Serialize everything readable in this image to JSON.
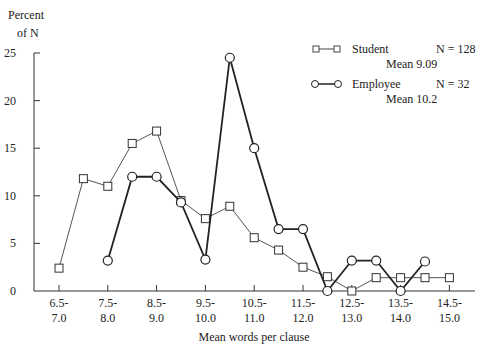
{
  "chart_data": {
    "type": "line",
    "title": "",
    "ylabel_line1": "Percent",
    "ylabel_line2": "of N",
    "xlabel": "Mean words per clause",
    "ylim": [
      0,
      25
    ],
    "yticks": [
      0,
      5,
      10,
      15,
      20,
      25
    ],
    "xtick_labels": [
      [
        "6.5-",
        "7.0"
      ],
      [
        "7.5-",
        "8.0"
      ],
      [
        "8.5-",
        "9.0"
      ],
      [
        "9.5-",
        "10.0"
      ],
      [
        "10.5-",
        "11.0"
      ],
      [
        "11.5-",
        "12.0"
      ],
      [
        "12.5-",
        "13.0"
      ],
      [
        "13.5-",
        "14.0"
      ],
      [
        "14.5-",
        "15.0"
      ]
    ],
    "x": [
      6.5,
      7.0,
      7.5,
      8.0,
      8.5,
      9.0,
      9.5,
      10.0,
      10.5,
      11.0,
      11.5,
      12.0,
      12.5,
      13.0,
      13.5,
      14.0,
      14.5
    ],
    "grid": false,
    "legend_position": "upper right",
    "series": [
      {
        "name": "Student",
        "n_label": "N = 128",
        "mean_label": "Mean 9.09",
        "marker": "square",
        "x": [
          6.5,
          7.0,
          7.5,
          8.0,
          8.5,
          9.0,
          9.5,
          10.0,
          10.5,
          11.0,
          11.5,
          12.0,
          12.5,
          13.0,
          13.5,
          14.0,
          14.5
        ],
        "values": [
          2.4,
          11.8,
          11.0,
          15.5,
          16.8,
          9.5,
          7.6,
          8.9,
          5.6,
          4.3,
          2.5,
          1.5,
          0.0,
          1.4,
          1.4,
          1.4,
          1.4
        ]
      },
      {
        "name": "Employee",
        "n_label": "N = 32",
        "mean_label": "Mean 10.2",
        "marker": "circle",
        "x": [
          7.5,
          8.0,
          8.5,
          9.0,
          9.5,
          10.0,
          10.5,
          11.0,
          11.5,
          12.0,
          12.5,
          13.0,
          13.5,
          14.0
        ],
        "values": [
          3.2,
          12.0,
          12.0,
          9.3,
          3.3,
          24.5,
          15.0,
          6.5,
          6.5,
          0.0,
          3.2,
          3.2,
          0.0,
          3.1
        ]
      }
    ]
  }
}
